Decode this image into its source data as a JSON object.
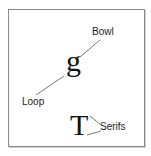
{
  "diagram": {
    "glyphs": {
      "g": "g",
      "T": "T"
    },
    "labels": {
      "bowl": "Bowl",
      "loop": "Loop",
      "serifs": "Serifs"
    },
    "colors": {
      "frame": "#8a8a8a",
      "line": "#555555",
      "text": "#222222"
    }
  }
}
